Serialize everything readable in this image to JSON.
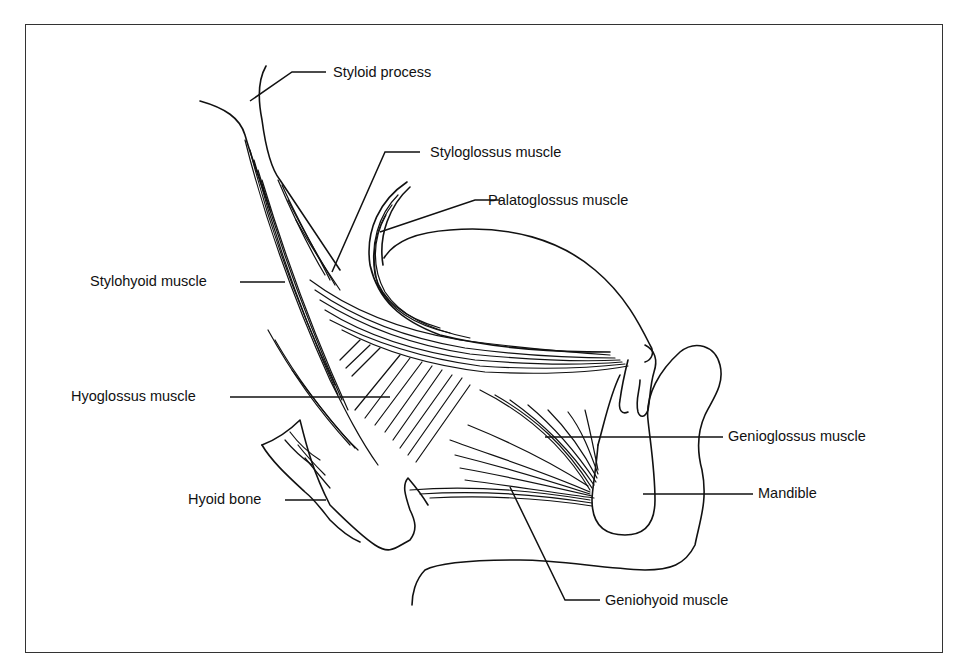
{
  "figure": {
    "type": "anatomical line drawing",
    "labels": [
      {
        "id": "styloid-process",
        "text": "Styloid process"
      },
      {
        "id": "styloglossus-muscle",
        "text": "Styloglossus muscle"
      },
      {
        "id": "palatoglossus-muscle",
        "text": "Palatoglossus muscle"
      },
      {
        "id": "stylohyoid-muscle",
        "text": "Stylohyoid muscle"
      },
      {
        "id": "hyoglossus-muscle",
        "text": "Hyoglossus muscle"
      },
      {
        "id": "genioglossus-muscle",
        "text": "Genioglossus muscle"
      },
      {
        "id": "hyoid-bone",
        "text": "Hyoid bone"
      },
      {
        "id": "mandible",
        "text": "Mandible"
      },
      {
        "id": "geniohyoid-muscle",
        "text": "Geniohyoid muscle"
      }
    ],
    "colors": {
      "ink": "#111111",
      "background": "#ffffff",
      "frame": "#333333"
    }
  }
}
